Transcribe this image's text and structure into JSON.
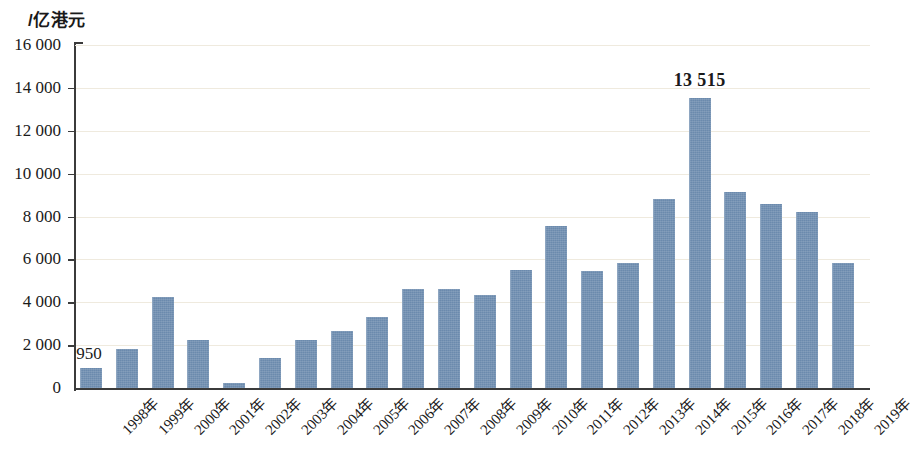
{
  "chart_data": {
    "type": "bar",
    "title": "",
    "subtitle": "",
    "unit_label": "/亿港元",
    "xlabel": "",
    "ylabel": "",
    "ylim": [
      0,
      16000
    ],
    "ytick_step": 2000,
    "grid": true,
    "legend": null,
    "bar_color": "#6b8aad",
    "gridline_color": "#efeade",
    "axis_color": "#3b3b3b",
    "ytick_labels": [
      "0",
      "2 000",
      "4 000",
      "6 000",
      "8 000",
      "10 000",
      "12 000",
      "14 000",
      "16 000"
    ],
    "ytick_values": [
      0,
      2000,
      4000,
      6000,
      8000,
      10000,
      12000,
      14000,
      16000
    ],
    "categories": [
      "1998年",
      "1999年",
      "2000年",
      "2001年",
      "2002年",
      "2003年",
      "2004年",
      "2005年",
      "2006年",
      "2007年",
      "2008年",
      "2009年",
      "2010年",
      "2011年",
      "2012年",
      "2013年",
      "2014年",
      "2015年",
      "2016年",
      "2017年",
      "2018年",
      "2019年"
    ],
    "values": [
      950,
      1840,
      4250,
      2250,
      250,
      1400,
      2250,
      2650,
      3300,
      4600,
      4600,
      4330,
      5500,
      7550,
      5450,
      5830,
      8800,
      13515,
      9130,
      8600,
      8200,
      5830
    ],
    "annotations": [
      {
        "text": "950",
        "category": "1998年",
        "value": 950,
        "bold": false
      },
      {
        "text": "13 515",
        "category": "2015年",
        "value": 13515,
        "bold": true
      }
    ]
  }
}
